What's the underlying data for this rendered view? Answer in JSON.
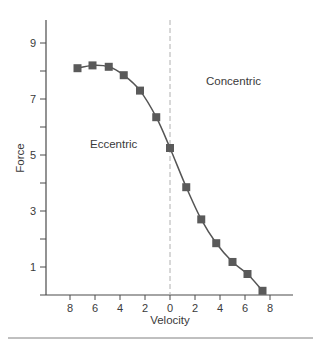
{
  "chart_data": {
    "type": "line",
    "title": "",
    "xlabel": "Velocity",
    "ylabel": "Force",
    "x_tick_labels": [
      "8",
      "6",
      "4",
      "2",
      "0",
      "2",
      "4",
      "6",
      "8"
    ],
    "x_tick_values": [
      -8,
      -6,
      -4,
      -2,
      0,
      2,
      4,
      6,
      8
    ],
    "y_tick_labels": [
      "1",
      "3",
      "5",
      "7",
      "9"
    ],
    "y_tick_values": [
      1,
      3,
      5,
      7,
      9
    ],
    "y_minor_ticks": [
      2,
      4,
      6,
      8
    ],
    "xlim": [
      -10,
      10
    ],
    "ylim": [
      0,
      10
    ],
    "grid": false,
    "annotations": [
      {
        "text": "Eccentric",
        "x": -3.5,
        "y": 5.3
      },
      {
        "text": "Concentric",
        "x": 5.2,
        "y": 7.7
      }
    ],
    "reference_line": {
      "x": 0,
      "style": "dashed"
    },
    "series": [
      {
        "name": "Force-velocity",
        "marker": "square",
        "x": [
          -7.4,
          -6.2,
          -4.9,
          -3.7,
          -2.4,
          -1.1,
          0,
          1.3,
          2.5,
          3.7,
          5.0,
          6.2,
          7.4
        ],
        "y": [
          8.1,
          8.2,
          8.15,
          7.85,
          7.3,
          6.35,
          5.25,
          3.85,
          2.7,
          1.85,
          1.18,
          0.75,
          0.15
        ]
      }
    ]
  },
  "colors": {
    "axis": "#4a4a4a",
    "line": "#555555",
    "marker": "#5a5a5a",
    "dashed": "#b0b0b0",
    "rule": "#808080"
  }
}
